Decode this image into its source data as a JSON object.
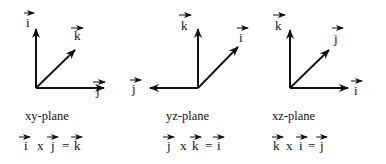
{
  "figure": {
    "panels": [
      {
        "plane_label": "xy-plane",
        "vectors": {
          "up": "i",
          "diagonal": "k",
          "horizontal": "j"
        },
        "horizontal_direction": "right",
        "equation": {
          "lhs1": "i",
          "op": "x",
          "lhs2": "j",
          "eq": "=",
          "rhs": "k"
        }
      },
      {
        "plane_label": "yz-plane",
        "vectors": {
          "up": "k",
          "diagonal": "i",
          "horizontal": "j"
        },
        "horizontal_direction": "left",
        "equation": {
          "lhs1": "j",
          "op": "x",
          "lhs2": "k",
          "eq": "=",
          "rhs": "i"
        }
      },
      {
        "plane_label": "xz-plane",
        "vectors": {
          "up": "k",
          "diagonal": "j",
          "horizontal": "i"
        },
        "horizontal_direction": "right",
        "equation": {
          "lhs1": "k",
          "op": "x",
          "lhs2": "i",
          "eq": "=",
          "rhs": "j"
        }
      }
    ],
    "colors": {
      "ink": "#111111",
      "background": "#ffffff"
    }
  }
}
